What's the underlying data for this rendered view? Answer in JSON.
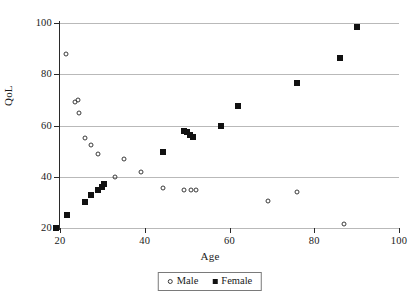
{
  "chart_data": {
    "type": "scatter",
    "title": "",
    "xlabel": "Age",
    "ylabel": "QoL",
    "xlim": [
      20,
      100
    ],
    "ylim": [
      20,
      100
    ],
    "xticks": [
      20,
      40,
      60,
      80,
      100
    ],
    "yticks": [
      20,
      40,
      60,
      80,
      100
    ],
    "grid": "horizontal",
    "legend_position": "bottom-center",
    "series": [
      {
        "name": "Male",
        "marker": "open-circle",
        "color": "#3a3a3a",
        "points": [
          {
            "x": 21.5,
            "y": 87.8
          },
          {
            "x": 23.5,
            "y": 69.2
          },
          {
            "x": 24.3,
            "y": 70.0
          },
          {
            "x": 24.5,
            "y": 64.8
          },
          {
            "x": 25.8,
            "y": 55.0
          },
          {
            "x": 27.3,
            "y": 52.2
          },
          {
            "x": 29.0,
            "y": 49.0
          },
          {
            "x": 33.0,
            "y": 40.0
          },
          {
            "x": 35.0,
            "y": 47.0
          },
          {
            "x": 39.0,
            "y": 42.0
          },
          {
            "x": 44.3,
            "y": 35.8
          },
          {
            "x": 49.3,
            "y": 35.0
          },
          {
            "x": 51.0,
            "y": 35.0
          },
          {
            "x": 52.0,
            "y": 35.0
          },
          {
            "x": 69.0,
            "y": 30.7
          },
          {
            "x": 76.0,
            "y": 34.0
          },
          {
            "x": 87.0,
            "y": 21.5
          }
        ]
      },
      {
        "name": "Female",
        "marker": "filled-square",
        "color": "#111111",
        "points": [
          {
            "x": 19.0,
            "y": 20.0
          },
          {
            "x": 21.7,
            "y": 25.0
          },
          {
            "x": 26.0,
            "y": 30.0
          },
          {
            "x": 27.3,
            "y": 33.0
          },
          {
            "x": 29.0,
            "y": 35.0
          },
          {
            "x": 29.8,
            "y": 36.0
          },
          {
            "x": 30.3,
            "y": 37.0
          },
          {
            "x": 44.3,
            "y": 49.8
          },
          {
            "x": 49.2,
            "y": 57.8
          },
          {
            "x": 50.0,
            "y": 57.3
          },
          {
            "x": 50.7,
            "y": 56.3
          },
          {
            "x": 51.5,
            "y": 55.7
          },
          {
            "x": 58.0,
            "y": 59.8
          },
          {
            "x": 62.0,
            "y": 67.7
          },
          {
            "x": 76.0,
            "y": 76.7
          },
          {
            "x": 86.0,
            "y": 86.5
          },
          {
            "x": 90.0,
            "y": 98.5
          }
        ]
      }
    ]
  },
  "legend": {
    "entries": [
      {
        "label": "Male"
      },
      {
        "label": "Female"
      }
    ]
  },
  "icons": {
    "male_marker": "open-circle-icon",
    "female_marker": "filled-square-icon"
  }
}
